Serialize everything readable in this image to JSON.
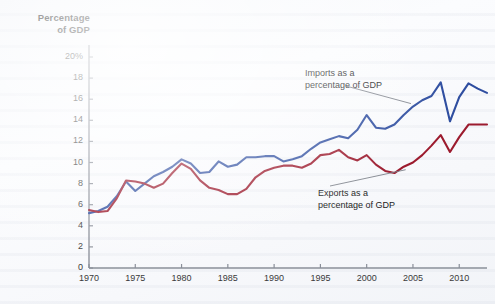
{
  "figure": {
    "y_axis_title_line1": "Percentage",
    "y_axis_title_line2": "of GDP",
    "imports_annotation_line1": "Imports as a",
    "imports_annotation_line2": "percentage of GDP",
    "exports_annotation_line1": "Exports as a",
    "exports_annotation_line2": "percentage of GDP",
    "imports_color": "#2f4ea0",
    "exports_color": "#9c1b2e",
    "axis_color": "#8a8f99",
    "background_color": "#f5f7fa"
  },
  "chart_data": {
    "type": "line",
    "title": "",
    "xlabel": "",
    "ylabel": "Percentage of GDP",
    "xlim": [
      1970,
      2013
    ],
    "ylim": [
      0,
      20
    ],
    "grid": false,
    "legend_position": "inline-annotations",
    "ytick_labels": [
      "0",
      "2",
      "4",
      "6",
      "8",
      "10",
      "12",
      "14",
      "16",
      "18",
      "20%"
    ],
    "yticks": [
      0,
      2,
      4,
      6,
      8,
      10,
      12,
      14,
      16,
      18,
      20
    ],
    "xtick_labels": [
      "1970",
      "1975",
      "1980",
      "1985",
      "1990",
      "1995",
      "2000",
      "2005",
      "2010"
    ],
    "xticks": [
      1970,
      1975,
      1980,
      1985,
      1990,
      1995,
      2000,
      2005,
      2010
    ],
    "x": [
      1970,
      1971,
      1972,
      1973,
      1974,
      1975,
      1976,
      1977,
      1978,
      1979,
      1980,
      1981,
      1982,
      1983,
      1984,
      1985,
      1986,
      1987,
      1988,
      1989,
      1990,
      1991,
      1992,
      1993,
      1994,
      1995,
      1996,
      1997,
      1998,
      1999,
      2000,
      2001,
      2002,
      2003,
      2004,
      2005,
      2006,
      2007,
      2008,
      2009,
      2010,
      2011,
      2012,
      2013
    ],
    "series": [
      {
        "name": "Imports as a percentage of GDP",
        "color": "#2f4ea0",
        "values": [
          5.2,
          5.4,
          5.8,
          6.8,
          8.2,
          7.3,
          8.0,
          8.7,
          9.1,
          9.6,
          10.3,
          9.9,
          9.0,
          9.1,
          10.1,
          9.6,
          9.8,
          10.5,
          10.5,
          10.6,
          10.6,
          10.1,
          10.3,
          10.6,
          11.3,
          11.9,
          12.2,
          12.5,
          12.3,
          13.1,
          14.5,
          13.3,
          13.2,
          13.6,
          14.5,
          15.3,
          15.9,
          16.3,
          17.6,
          13.9,
          16.2,
          17.5,
          17.0,
          16.6
        ]
      },
      {
        "name": "Exports as a percentage of GDP",
        "color": "#9c1b2e",
        "values": [
          5.5,
          5.3,
          5.4,
          6.6,
          8.3,
          8.2,
          8.0,
          7.6,
          8.0,
          9.0,
          9.9,
          9.4,
          8.3,
          7.6,
          7.4,
          7.0,
          7.0,
          7.5,
          8.6,
          9.2,
          9.5,
          9.7,
          9.7,
          9.5,
          9.9,
          10.7,
          10.8,
          11.2,
          10.5,
          10.2,
          10.7,
          9.8,
          9.2,
          9.0,
          9.6,
          10.0,
          10.7,
          11.6,
          12.6,
          11.0,
          12.4,
          13.6,
          13.6,
          13.6
        ]
      }
    ],
    "annotations": [
      {
        "text": "Imports as a percentage of GDP",
        "points_to_year": 2005,
        "points_to_value": 15.3
      },
      {
        "text": "Exports as a percentage of GDP",
        "points_to_year": 2004,
        "points_to_value": 9.6
      }
    ]
  }
}
